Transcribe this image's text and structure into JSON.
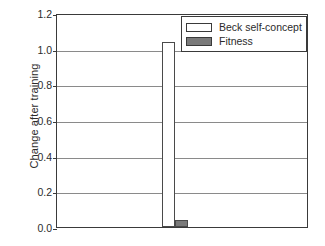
{
  "chart_data": {
    "type": "bar",
    "title": "",
    "xlabel": "",
    "ylabel": "Change after training",
    "ylim": [
      0.0,
      1.2
    ],
    "yticks": [
      "1.2",
      "1.0",
      "0.8",
      "0.6",
      "0.4",
      "0.2",
      "0.0"
    ],
    "ytick_values": [
      1.2,
      1.0,
      0.8,
      0.6,
      0.4,
      0.2,
      0.0
    ],
    "grid": true,
    "grid_axis": "y",
    "categories": [
      ""
    ],
    "legend_position": "top-right",
    "series": [
      {
        "name": "Beck self-concept",
        "values": [
          1.04
        ],
        "color": "#ffffff",
        "edge_color": "#4a4a4a"
      },
      {
        "name": "Fitness",
        "values": [
          0.04
        ],
        "color": "#7a7a7a",
        "edge_color": "#4a4a4a"
      }
    ]
  },
  "axis": {
    "y_title": "Change after training",
    "ticks": [
      {
        "label": "1.2",
        "value": 1.2
      },
      {
        "label": "1.0",
        "value": 1.0
      },
      {
        "label": "0.8",
        "value": 0.8
      },
      {
        "label": "0.6",
        "value": 0.6
      },
      {
        "label": "0.4",
        "value": 0.4
      },
      {
        "label": "0.2",
        "value": 0.2
      },
      {
        "label": "0.0",
        "value": 0.0
      }
    ]
  },
  "legend": {
    "items": [
      {
        "label": "Beck self-concept",
        "swatch": "white"
      },
      {
        "label": "Fitness",
        "swatch": "gray"
      }
    ]
  },
  "colors": {
    "frame": "#3a3a3a",
    "gridline": "#8a8a8a",
    "bar_fill_gray": "#7a7a7a",
    "bar_fill_white": "#ffffff",
    "bar_edge": "#4a4a4a",
    "background": "#ffffff",
    "text": "#2b2b2b"
  }
}
